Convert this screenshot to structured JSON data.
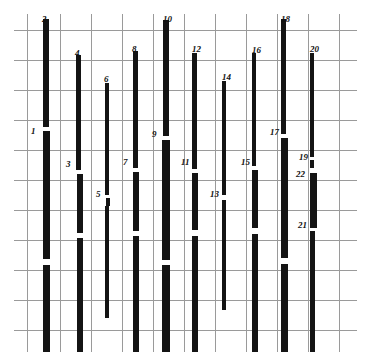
{
  "figure": {
    "title": "",
    "background_color": "#ffffff",
    "bar_color": "#141414",
    "grid_color": "#9a9a9a",
    "label_color": "#111111",
    "width": 371,
    "height": 362
  },
  "chart_data": {
    "type": "bar",
    "title": "",
    "xlabel": "",
    "ylabel": "",
    "grid": true,
    "legend": "none",
    "orientation": "vertical-segmented-bars",
    "xlim": [
      0,
      371
    ],
    "ylim": [
      0,
      362
    ],
    "grid_lines": {
      "horizontal_y": [
        30,
        60,
        90,
        120,
        150,
        180,
        210,
        240,
        270,
        300,
        330
      ],
      "vertical_x": [
        27,
        60,
        91,
        122,
        153,
        184,
        215,
        246,
        277,
        308,
        339
      ],
      "frame_left": 14,
      "frame_right": 357,
      "frame_top": 14,
      "frame_bottom": 352
    },
    "categories": [
      "1",
      "2",
      "3",
      "4",
      "5",
      "6",
      "7",
      "8",
      "9",
      "10",
      "11",
      "12",
      "13",
      "14",
      "15",
      "16",
      "17",
      "18",
      "19",
      "20",
      "21",
      "22"
    ],
    "values": [
      185,
      340,
      175,
      290,
      185,
      250,
      200,
      275,
      225,
      330,
      190,
      280,
      155,
      255,
      165,
      290,
      215,
      330,
      200,
      275,
      80,
      60
    ],
    "bars": [
      {
        "id": "1",
        "label": "1",
        "x": 43,
        "width": 7,
        "segments": [
          [
            131,
            259
          ],
          [
            265,
            352
          ]
        ],
        "label_x": 31,
        "label_y": 127
      },
      {
        "id": "2",
        "label": "2",
        "x": 43,
        "width": 6,
        "segments": [
          [
            19,
            127
          ]
        ],
        "label_x": 42,
        "label_y": 15
      },
      {
        "id": "3",
        "label": "3",
        "x": 77,
        "width": 6,
        "segments": [
          [
            174,
            233
          ],
          [
            238,
            352
          ]
        ],
        "label_x": 66,
        "label_y": 160
      },
      {
        "id": "4",
        "label": "4",
        "x": 76,
        "width": 5,
        "segments": [
          [
            55,
            170
          ]
        ],
        "label_x": 75,
        "label_y": 49
      },
      {
        "id": "5",
        "label": "5",
        "x": 106,
        "width": 4,
        "segments": [
          [
            198,
            206
          ]
        ],
        "label_x": 96,
        "label_y": 190
      },
      {
        "id": "6",
        "label": "6",
        "x": 105,
        "width": 4,
        "segments": [
          [
            83,
            195
          ],
          [
            206,
            318
          ]
        ],
        "label_x": 104,
        "label_y": 75
      },
      {
        "id": "7",
        "label": "7",
        "x": 133,
        "width": 6,
        "segments": [
          [
            172,
            231
          ],
          [
            236,
            352
          ]
        ],
        "label_x": 123,
        "label_y": 158
      },
      {
        "id": "8",
        "label": "8",
        "x": 133,
        "width": 5,
        "segments": [
          [
            51,
            168
          ]
        ],
        "label_x": 132,
        "label_y": 45
      },
      {
        "id": "9",
        "label": "9",
        "x": 162,
        "width": 8,
        "segments": [
          [
            140,
            260
          ],
          [
            265,
            352
          ]
        ],
        "label_x": 152,
        "label_y": 130
      },
      {
        "id": "10",
        "label": "10",
        "x": 163,
        "width": 6,
        "segments": [
          [
            20,
            136
          ]
        ],
        "label_x": 163,
        "label_y": 15
      },
      {
        "id": "11",
        "label": "11",
        "x": 192,
        "width": 6,
        "segments": [
          [
            173,
            230
          ],
          [
            236,
            352
          ]
        ],
        "label_x": 181,
        "label_y": 158
      },
      {
        "id": "12",
        "label": "12",
        "x": 192,
        "width": 5,
        "segments": [
          [
            53,
            169
          ]
        ],
        "label_x": 192,
        "label_y": 45
      },
      {
        "id": "13",
        "label": "13",
        "x": 222,
        "width": 4,
        "segments": [
          [
            200,
            310
          ]
        ],
        "label_x": 210,
        "label_y": 190
      },
      {
        "id": "14",
        "label": "14",
        "x": 222,
        "width": 4,
        "segments": [
          [
            81,
            195
          ]
        ],
        "label_x": 222,
        "label_y": 73
      },
      {
        "id": "15",
        "label": "15",
        "x": 252,
        "width": 6,
        "segments": [
          [
            170,
            228
          ],
          [
            234,
            352
          ]
        ],
        "label_x": 241,
        "label_y": 158
      },
      {
        "id": "16",
        "label": "16",
        "x": 252,
        "width": 4,
        "segments": [
          [
            53,
            166
          ]
        ],
        "label_x": 252,
        "label_y": 46
      },
      {
        "id": "17",
        "label": "17",
        "x": 281,
        "width": 7,
        "segments": [
          [
            138,
            258
          ],
          [
            264,
            352
          ]
        ],
        "label_x": 270,
        "label_y": 128
      },
      {
        "id": "18",
        "label": "18",
        "x": 281,
        "width": 5,
        "segments": [
          [
            19,
            134
          ]
        ],
        "label_x": 281,
        "label_y": 15
      },
      {
        "id": "19",
        "label": "19",
        "x": 310,
        "width": 4,
        "segments": [
          [
            160,
            168
          ]
        ],
        "label_x": 299,
        "label_y": 153
      },
      {
        "id": "20",
        "label": "20",
        "x": 310,
        "width": 4,
        "segments": [
          [
            53,
            157
          ]
        ],
        "label_x": 310,
        "label_y": 45
      },
      {
        "id": "21",
        "label": "21",
        "x": 310,
        "width": 5,
        "segments": [
          [
            231,
            352
          ]
        ],
        "label_x": 298,
        "label_y": 221
      },
      {
        "id": "22",
        "label": "22",
        "x": 310,
        "width": 7,
        "segments": [
          [
            173,
            228
          ]
        ],
        "label_x": 296,
        "label_y": 170
      }
    ]
  }
}
